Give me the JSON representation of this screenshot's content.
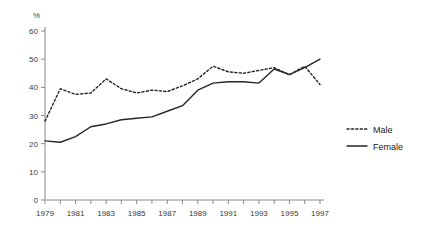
{
  "chart_data": {
    "type": "line",
    "title": "",
    "subtitle": "",
    "xlabel": "",
    "ylabel": "%",
    "unit_label": "%",
    "grid": false,
    "legend_position": "right",
    "xlim": [
      1979,
      1997
    ],
    "ylim": [
      0,
      60
    ],
    "y_ticks": [
      0,
      10,
      20,
      30,
      40,
      50,
      60
    ],
    "y_tick_labels": [
      "0",
      "10",
      "20",
      "30",
      "40",
      "50",
      "60"
    ],
    "x": [
      1979,
      1980,
      1981,
      1982,
      1983,
      1984,
      1985,
      1986,
      1987,
      1988,
      1989,
      1990,
      1991,
      1992,
      1993,
      1994,
      1995,
      1996,
      1997
    ],
    "x_tick_labels": [
      "1979",
      "1981",
      "1983",
      "1985",
      "1987",
      "1989",
      "1991",
      "1993",
      "1995",
      "1997"
    ],
    "x_tick_values": [
      1979,
      1981,
      1983,
      1985,
      1987,
      1989,
      1991,
      1993,
      1995,
      1997
    ],
    "x_minor_ticks": [
      1979,
      1980,
      1981,
      1982,
      1983,
      1984,
      1985,
      1986,
      1987,
      1988,
      1989,
      1990,
      1991,
      1992,
      1993,
      1994,
      1995,
      1996,
      1997
    ],
    "series": [
      {
        "name": "Male",
        "style": "dotted",
        "color": "#262626",
        "values": [
          28,
          39.5,
          37.5,
          38,
          43,
          39.5,
          38,
          39,
          38.5,
          40.5,
          43,
          47.5,
          45.5,
          45,
          46,
          47,
          44.5,
          47.5,
          41
        ]
      },
      {
        "name": "Female",
        "style": "solid",
        "color": "#262626",
        "values": [
          21,
          20.5,
          22.5,
          26,
          27,
          28.5,
          29,
          29.5,
          31.5,
          33.5,
          39,
          41.5,
          42,
          42,
          41.5,
          46.5,
          44.5,
          47,
          50
        ]
      }
    ]
  },
  "legend": {
    "items": [
      {
        "label": "Male",
        "style": "dotted"
      },
      {
        "label": "Female",
        "style": "solid"
      }
    ]
  }
}
